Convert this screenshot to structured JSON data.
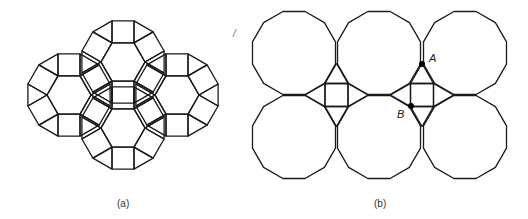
{
  "figure_a": {
    "caption": "(a)",
    "description": "Patch of 3.4.6.4 tiling: four hexagons each ringed by alternating squares and triangles",
    "edge": 22,
    "stroke": "#1a1a1a",
    "clusters": [
      {
        "cx": 123,
        "cy": 62
      },
      {
        "cx": 69,
        "cy": 95
      },
      {
        "cx": 177,
        "cy": 95
      },
      {
        "cx": 123,
        "cy": 128
      }
    ]
  },
  "figure_b": {
    "caption": "(b)",
    "stray_mark": "/",
    "description": "Six regular dodecagons in two rows with square-and-triangle fillers",
    "stroke": "#1a1a1a",
    "radius": 43,
    "dodecagons": [
      {
        "cx": 294,
        "cy": 53
      },
      {
        "cx": 379,
        "cy": 53
      },
      {
        "cx": 465,
        "cy": 53
      },
      {
        "cx": 294,
        "cy": 137
      },
      {
        "cx": 379,
        "cy": 137
      },
      {
        "cx": 465,
        "cy": 137
      }
    ],
    "points": [
      {
        "label": "A",
        "x": 422,
        "y": 64,
        "lx": 429,
        "ly": 52
      },
      {
        "label": "B",
        "x": 411,
        "y": 106,
        "lx": 397,
        "ly": 108
      }
    ]
  }
}
